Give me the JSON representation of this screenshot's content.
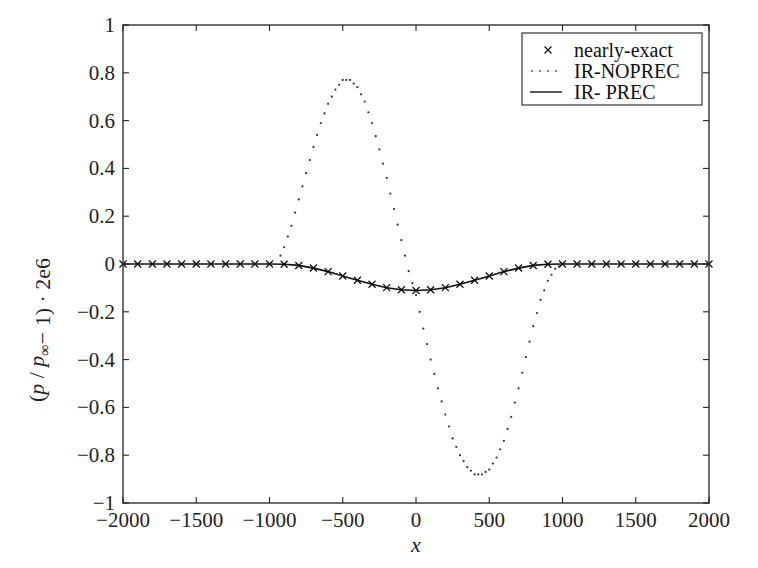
{
  "chart_data": {
    "type": "line",
    "title": "",
    "xlabel": "x",
    "ylabel": "(p / p∞ − 1) · 2e6",
    "xlim": [
      -2000,
      2000
    ],
    "ylim": [
      -1,
      1
    ],
    "grid": false,
    "legend_position": "upper right",
    "x_ticks": [
      -2000,
      -1500,
      -1000,
      -500,
      0,
      500,
      1000,
      1500,
      2000
    ],
    "x_tick_labels": [
      "−2000",
      "−1500",
      "−1000",
      "−500",
      "0",
      "500",
      "1000",
      "1500",
      "2000"
    ],
    "y_ticks": [
      1,
      0.8,
      0.6,
      0.4,
      0.2,
      0,
      -0.2,
      -0.4,
      -0.6,
      -0.8,
      -1
    ],
    "y_tick_labels": [
      "1",
      "0.8",
      "0.6",
      "0.4",
      "0.2",
      "0",
      "−0.2",
      "−0.4",
      "−0.6",
      "−0.8",
      "−1"
    ],
    "series": [
      {
        "name": "nearly-exact",
        "style": "markers-x",
        "x": [
          -2000,
          -1900,
          -1800,
          -1700,
          -1600,
          -1500,
          -1400,
          -1300,
          -1200,
          -1100,
          -1000,
          -900,
          -800,
          -700,
          -600,
          -500,
          -400,
          -300,
          -200,
          -100,
          0,
          100,
          200,
          300,
          400,
          500,
          600,
          700,
          800,
          900,
          1000,
          1100,
          1200,
          1300,
          1400,
          1500,
          1600,
          1700,
          1800,
          1900,
          2000
        ],
        "values": [
          0,
          0,
          0,
          0,
          0,
          0,
          0,
          0,
          0,
          0,
          0,
          -0.001,
          -0.006,
          -0.017,
          -0.032,
          -0.05,
          -0.068,
          -0.085,
          -0.099,
          -0.108,
          -0.111,
          -0.108,
          -0.099,
          -0.085,
          -0.068,
          -0.05,
          -0.032,
          -0.017,
          -0.006,
          -0.001,
          0,
          0,
          0,
          0,
          0,
          0,
          0,
          0,
          0,
          0,
          0
        ]
      },
      {
        "name": "IR-NOPREC",
        "style": "dotted",
        "x": [
          -2000,
          -1500,
          -1000,
          -950,
          -900,
          -850,
          -800,
          -750,
          -700,
          -650,
          -600,
          -550,
          -500,
          -450,
          -400,
          -350,
          -300,
          -250,
          -200,
          -150,
          -100,
          -50,
          0,
          50,
          100,
          150,
          200,
          250,
          300,
          350,
          400,
          450,
          500,
          550,
          600,
          650,
          700,
          750,
          800,
          850,
          900,
          950,
          1000,
          1500,
          2000
        ],
        "values": [
          0,
          0,
          0,
          0.0,
          0.07,
          0.16,
          0.27,
          0.38,
          0.49,
          0.59,
          0.67,
          0.73,
          0.77,
          0.77,
          0.74,
          0.68,
          0.59,
          0.48,
          0.36,
          0.23,
          0.1,
          -0.03,
          -0.13,
          -0.27,
          -0.4,
          -0.52,
          -0.63,
          -0.73,
          -0.8,
          -0.85,
          -0.88,
          -0.88,
          -0.86,
          -0.81,
          -0.74,
          -0.64,
          -0.52,
          -0.39,
          -0.26,
          -0.15,
          -0.07,
          -0.02,
          0,
          0,
          0
        ]
      },
      {
        "name": "IR- PREC",
        "style": "solid",
        "x": [
          -2000,
          -1900,
          -1800,
          -1700,
          -1600,
          -1500,
          -1400,
          -1300,
          -1200,
          -1100,
          -1000,
          -900,
          -800,
          -700,
          -600,
          -500,
          -400,
          -300,
          -200,
          -100,
          0,
          100,
          200,
          300,
          400,
          500,
          600,
          700,
          800,
          900,
          1000,
          1100,
          1200,
          1300,
          1400,
          1500,
          1600,
          1700,
          1800,
          1900,
          2000
        ],
        "values": [
          0,
          0,
          0,
          0,
          0,
          0,
          0,
          0,
          0,
          0,
          0,
          -0.001,
          -0.006,
          -0.017,
          -0.032,
          -0.05,
          -0.068,
          -0.085,
          -0.099,
          -0.108,
          -0.111,
          -0.108,
          -0.099,
          -0.085,
          -0.068,
          -0.05,
          -0.032,
          -0.017,
          -0.006,
          -0.001,
          0,
          0,
          0,
          0,
          0,
          0,
          0,
          0,
          0,
          0,
          0
        ]
      }
    ]
  },
  "legend": {
    "items": [
      {
        "label": "nearly-exact",
        "symbol": "×"
      },
      {
        "label": "IR-NOPREC",
        "symbol": "dotted-line"
      },
      {
        "label": "IR- PREC",
        "symbol": "solid-line"
      }
    ]
  },
  "colors": {
    "axis": "#222222",
    "series": "#111111",
    "background": "#ffffff"
  }
}
